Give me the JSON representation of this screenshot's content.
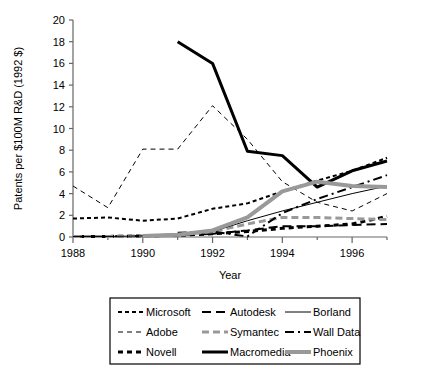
{
  "chart_data": {
    "type": "line",
    "title": "",
    "xlabel": "Year",
    "ylabel": "Patents per $100M R&D (1992 $)",
    "xlim": [
      1988,
      1997
    ],
    "ylim": [
      0,
      20
    ],
    "xticks": [
      1988,
      1990,
      1992,
      1994,
      1996
    ],
    "xtick_labels": [
      "1988",
      "1990",
      "1992",
      "1994",
      "1996"
    ],
    "yticks": [
      0,
      2,
      4,
      6,
      8,
      10,
      12,
      14,
      16,
      18,
      20
    ],
    "ytick_labels": [
      "0",
      "2",
      "4",
      "6",
      "8",
      "10",
      "12",
      "14",
      "16",
      "18",
      "20"
    ],
    "grid": false,
    "legend_position": "below",
    "series": [
      {
        "name": "Microsoft",
        "style": "fine-dash",
        "color": "#000000",
        "width": 2,
        "x": [
          1988,
          1989,
          1990,
          1991,
          1992,
          1993,
          1994,
          1995,
          1996,
          1997
        ],
        "values": [
          1.7,
          1.8,
          1.5,
          1.7,
          2.6,
          3.1,
          4.2,
          5.2,
          6.1,
          7.3
        ]
      },
      {
        "name": "Adobe",
        "style": "thin-dash",
        "color": "#000000",
        "width": 1,
        "x": [
          1988,
          1989,
          1990,
          1991,
          1992,
          1993,
          1994,
          1995,
          1996,
          1997
        ],
        "values": [
          4.7,
          2.7,
          8.1,
          8.1,
          12.1,
          9.0,
          5.1,
          3.2,
          2.4,
          4.0
        ]
      },
      {
        "name": "Novell",
        "style": "heavy-dash",
        "color": "#000000",
        "width": 3,
        "x": [
          1988,
          1989,
          1990,
          1991,
          1992,
          1993,
          1994,
          1995,
          1996,
          1997
        ],
        "values": [
          0.05,
          0.05,
          0.1,
          0.15,
          0.3,
          0.5,
          0.8,
          1.0,
          1.2,
          1.9
        ]
      },
      {
        "name": "Autodesk",
        "style": "long-dash",
        "color": "#000000",
        "width": 2,
        "x": [
          1988,
          1989,
          1990,
          1991,
          1992,
          1993,
          1994,
          1995,
          1996,
          1997
        ],
        "values": [
          0.05,
          0.05,
          0.1,
          0.15,
          0.3,
          0.6,
          1.0,
          1.0,
          1.1,
          1.2
        ]
      },
      {
        "name": "Symantec",
        "style": "gray-dash",
        "color": "#999999",
        "width": 3,
        "x": [
          1988,
          1989,
          1990,
          1991,
          1992,
          1993,
          1994,
          1995,
          1996,
          1997
        ],
        "values": [
          0.05,
          0.05,
          0.1,
          0.2,
          0.5,
          1.2,
          1.8,
          1.8,
          1.7,
          1.6
        ]
      },
      {
        "name": "Macromedia",
        "style": "heavy-solid",
        "color": "#000000",
        "width": 3,
        "x": [
          1991,
          1992,
          1993,
          1994,
          1995,
          1996,
          1997
        ],
        "values": [
          18.0,
          16.0,
          7.9,
          7.5,
          4.6,
          6.1,
          7.0
        ]
      },
      {
        "name": "Borland",
        "style": "thin-solid",
        "color": "#000000",
        "width": 1,
        "x": [
          1988,
          1989,
          1990,
          1991,
          1992,
          1993,
          1994,
          1995,
          1996,
          1997
        ],
        "values": [
          0.05,
          0.05,
          0.1,
          0.2,
          0.5,
          1.5,
          2.4,
          3.2,
          4.0,
          4.7
        ]
      },
      {
        "name": "Wall Data",
        "style": "dash-dot",
        "color": "#000000",
        "width": 2,
        "x": [
          1991,
          1992,
          1993,
          1994,
          1995,
          1996,
          1997
        ],
        "values": [
          0.4,
          0.5,
          0.05,
          2.2,
          3.5,
          4.6,
          5.7
        ]
      },
      {
        "name": "Phoenix",
        "style": "gray-solid",
        "color": "#999999",
        "width": 4,
        "x": [
          1990,
          1991,
          1992,
          1993,
          1994,
          1995,
          1996,
          1997
        ],
        "values": [
          0.1,
          0.2,
          0.6,
          1.8,
          4.2,
          5.1,
          4.7,
          4.6
        ]
      }
    ],
    "legend_rows": [
      [
        "Microsoft",
        "Autodesk",
        "Borland"
      ],
      [
        "Adobe",
        "Symantec",
        "Wall Data"
      ],
      [
        "Novell",
        "Macromedia",
        "Phoenix"
      ]
    ]
  },
  "colors": {
    "axis": "#666666",
    "ink": "#000000",
    "gray_series": "#999999",
    "legend_border": "#000000",
    "background": "#ffffff"
  }
}
